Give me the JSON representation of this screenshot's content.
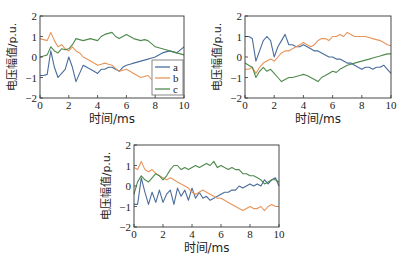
{
  "chart_data": [
    {
      "type": "line",
      "title": "",
      "xlabel": "时间/ms",
      "ylabel": "电压幅值/p.u.",
      "xlim": [
        0,
        10
      ],
      "ylim": [
        -2,
        2
      ],
      "xticks": [
        "0",
        "2",
        "4",
        "6",
        "8",
        "10"
      ],
      "yticks": [
        "2",
        "1",
        "0",
        "−1",
        "−2"
      ],
      "grid": false,
      "legend": {
        "position": "lower right",
        "entries": [
          "a",
          "b",
          "c"
        ]
      },
      "x": [
        0,
        0.25,
        0.5,
        0.75,
        1,
        1.25,
        1.5,
        1.75,
        2,
        2.25,
        2.5,
        2.75,
        3,
        3.25,
        3.5,
        3.75,
        4,
        4.25,
        4.5,
        4.75,
        5,
        5.25,
        5.5,
        5.75,
        6,
        6.25,
        6.5,
        6.75,
        7,
        7.25,
        7.5,
        7.75,
        8,
        8.25,
        8.5,
        8.75,
        9,
        9.25,
        9.5,
        9.75,
        10
      ],
      "series": [
        {
          "name": "a",
          "color": "#4a6d9c",
          "values": [
            -0.9,
            -0.9,
            -0.85,
            0.3,
            -0.5,
            -1.0,
            -0.8,
            -0.6,
            0.0,
            -0.5,
            -1.2,
            -0.8,
            -0.4,
            -0.5,
            -0.6,
            -0.7,
            -0.8,
            -0.6,
            -0.6,
            -0.5,
            -0.5,
            -0.6,
            -0.7,
            -0.5,
            -0.4,
            -0.35,
            -0.3,
            -0.25,
            -0.2,
            -0.15,
            -0.1,
            -0.05,
            0.0,
            0.1,
            0.2,
            0.25,
            0.3,
            0.25,
            0.2,
            0.35,
            0.5
          ]
        },
        {
          "name": "b",
          "color": "#e8955a",
          "values": [
            0.9,
            0.85,
            0.8,
            1.2,
            0.8,
            0.5,
            0.6,
            0.4,
            0.3,
            0.5,
            0.3,
            0.2,
            0.0,
            -0.1,
            -0.2,
            -0.3,
            -0.4,
            -0.35,
            -0.3,
            -0.35,
            -0.4,
            -0.55,
            -0.7,
            -0.65,
            -0.6,
            -0.7,
            -0.8,
            -0.9,
            -1.0,
            -0.95,
            -0.9,
            -1.1,
            null,
            null,
            null,
            null,
            null,
            null,
            null,
            null,
            null
          ]
        },
        {
          "name": "c",
          "color": "#4f8a4f",
          "values": [
            0.0,
            0.05,
            0.1,
            0.5,
            0.3,
            0.2,
            0.4,
            0.35,
            0.4,
            0.6,
            0.9,
            0.85,
            0.8,
            0.85,
            0.9,
            0.85,
            0.8,
            1.0,
            1.1,
            1.15,
            1.2,
            1.0,
            0.9,
            1.0,
            1.1,
            1.0,
            0.9,
            0.85,
            0.8,
            0.85,
            0.8,
            0.65,
            0.5,
            0.45,
            0.4,
            0.35,
            0.3,
            0.25,
            0.2,
            0.15,
            0.1
          ]
        }
      ]
    },
    {
      "type": "line",
      "title": "",
      "xlabel": "时间/ms",
      "ylabel": "电压幅值/p.u.",
      "xlim": [
        0,
        10
      ],
      "ylim": [
        -2,
        2
      ],
      "xticks": [
        "0",
        "2",
        "4",
        "6",
        "8",
        "10"
      ],
      "yticks": [
        "2",
        "1",
        "0",
        "−1",
        "−2"
      ],
      "grid": false,
      "x": [
        0,
        0.25,
        0.5,
        0.75,
        1,
        1.25,
        1.5,
        1.75,
        2,
        2.25,
        2.5,
        2.75,
        3,
        3.25,
        3.5,
        3.75,
        4,
        4.25,
        4.5,
        4.75,
        5,
        5.25,
        5.5,
        5.75,
        6,
        6.25,
        6.5,
        6.75,
        7,
        7.25,
        7.5,
        7.75,
        8,
        8.25,
        8.5,
        8.75,
        9,
        9.25,
        9.5,
        9.75,
        10
      ],
      "series": [
        {
          "name": "a",
          "color": "#4a6d9c",
          "values": [
            1.0,
            1.0,
            0.9,
            -0.2,
            0.3,
            0.8,
            1.0,
            0.8,
            0.0,
            0.5,
            0.8,
            1.1,
            0.6,
            0.6,
            0.5,
            0.5,
            0.6,
            0.5,
            0.4,
            0.3,
            0.3,
            0.2,
            0.1,
            0.0,
            0.0,
            -0.1,
            -0.1,
            -0.2,
            -0.3,
            -0.3,
            -0.4,
            -0.5,
            -0.6,
            -0.5,
            -0.5,
            -0.6,
            -0.5,
            -0.5,
            -0.4,
            -0.6,
            -0.8
          ]
        },
        {
          "name": "b",
          "color": "#e8955a",
          "values": [
            -0.6,
            -0.6,
            -0.5,
            -0.8,
            -0.5,
            -0.3,
            -0.2,
            -0.1,
            -0.2,
            0.0,
            0.2,
            0.3,
            0.3,
            0.4,
            0.5,
            0.6,
            0.7,
            0.6,
            0.5,
            0.6,
            0.8,
            0.9,
            0.9,
            0.8,
            1.0,
            1.0,
            1.1,
            1.0,
            1.2,
            1.1,
            1.0,
            1.0,
            1.0,
            1.0,
            0.95,
            0.9,
            0.85,
            0.8,
            0.7,
            0.6,
            0.55
          ]
        },
        {
          "name": "c",
          "color": "#4f8a4f",
          "values": [
            -0.3,
            -0.4,
            -0.5,
            -1.0,
            -0.7,
            -0.5,
            -0.7,
            -0.6,
            -0.8,
            -1.0,
            -1.2,
            -1.1,
            -1.0,
            -1.0,
            -0.95,
            -0.9,
            -0.85,
            -0.9,
            -1.0,
            -1.1,
            -1.2,
            -1.0,
            -0.9,
            -0.8,
            -0.7,
            -0.75,
            -0.6,
            -0.5,
            -0.4,
            -0.35,
            -0.3,
            -0.25,
            -0.2,
            -0.15,
            -0.1,
            -0.05,
            0.0,
            0.05,
            0.1,
            0.15,
            0.15
          ]
        }
      ]
    },
    {
      "type": "line",
      "title": "",
      "xlabel": "时间/ms",
      "ylabel": "电压幅值/p.u.",
      "xlim": [
        0,
        10
      ],
      "ylim": [
        -2,
        2
      ],
      "xticks": [
        "0",
        "2",
        "4",
        "6",
        "8",
        "10"
      ],
      "yticks": [
        "2",
        "1",
        "0",
        "−1",
        "−2"
      ],
      "grid": false,
      "x": [
        0,
        0.25,
        0.5,
        0.75,
        1,
        1.25,
        1.5,
        1.75,
        2,
        2.25,
        2.5,
        2.75,
        3,
        3.25,
        3.5,
        3.75,
        4,
        4.25,
        4.5,
        4.75,
        5,
        5.25,
        5.5,
        5.75,
        6,
        6.25,
        6.5,
        6.75,
        7,
        7.25,
        7.5,
        7.75,
        8,
        8.25,
        8.5,
        8.75,
        9,
        9.25,
        9.5,
        9.75,
        10
      ],
      "series": [
        {
          "name": "a",
          "color": "#4a6d9c",
          "values": [
            -0.9,
            -0.9,
            0.4,
            -0.3,
            -0.9,
            -0.3,
            -0.8,
            -0.2,
            -0.8,
            -0.4,
            -0.2,
            -0.9,
            -0.1,
            -0.5,
            -0.2,
            -0.7,
            -0.1,
            -0.6,
            -0.3,
            -0.6,
            -0.5,
            -0.7,
            -0.6,
            -0.5,
            -0.4,
            -0.3,
            -0.3,
            -0.2,
            -0.2,
            0.0,
            -0.1,
            0.0,
            0.1,
            0.0,
            0.1,
            0.0,
            0.3,
            0.1,
            0.3,
            0.4,
            0.0
          ]
        },
        {
          "name": "b",
          "color": "#e8955a",
          "values": [
            0.9,
            0.8,
            1.2,
            0.8,
            0.7,
            0.8,
            0.6,
            0.5,
            0.4,
            0.3,
            0.4,
            0.3,
            0.2,
            0.1,
            0.0,
            -0.1,
            -0.3,
            -0.4,
            -0.3,
            -0.2,
            -0.3,
            -0.4,
            -0.5,
            -0.6,
            -0.6,
            -0.7,
            -0.8,
            -0.9,
            -1.0,
            -1.1,
            -1.2,
            -1.1,
            -1.0,
            -1.1,
            -1.1,
            -1.0,
            -1.2,
            -1.0,
            -0.9,
            -1.0,
            -1.0
          ]
        },
        {
          "name": "c",
          "color": "#4f8a4f",
          "values": [
            -0.4,
            0.2,
            0.5,
            0.3,
            0.2,
            0.4,
            0.6,
            0.5,
            0.3,
            0.5,
            0.8,
            1.0,
            1.0,
            0.8,
            0.9,
            0.8,
            0.9,
            1.0,
            0.9,
            1.0,
            1.1,
            1.0,
            1.2,
            0.9,
            1.0,
            0.9,
            0.8,
            0.9,
            0.8,
            0.8,
            0.6,
            0.6,
            0.5,
            0.5,
            0.4,
            0.3,
            0.1,
            0.2,
            0.3,
            0.3,
            0.2
          ]
        }
      ]
    }
  ],
  "panels": [
    {
      "id": "top-left",
      "left": 40,
      "right": 184,
      "top": 16,
      "bottom": 98,
      "legend": true
    },
    {
      "id": "top-right",
      "left": 245,
      "right": 391,
      "top": 16,
      "bottom": 98,
      "legend": false
    },
    {
      "id": "bottom",
      "left": 134,
      "right": 279,
      "top": 145,
      "bottom": 227,
      "legend": false
    }
  ]
}
